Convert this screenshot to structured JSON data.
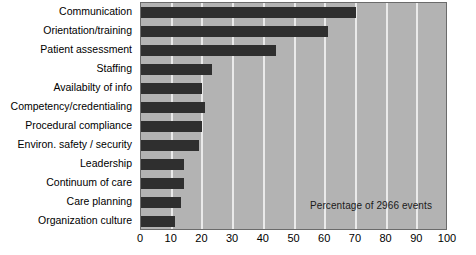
{
  "chart_data": {
    "type": "bar",
    "orientation": "horizontal",
    "title": "",
    "subtitle": "",
    "xlabel": "",
    "ylabel": "",
    "annotation": "Percentage of 2966 events",
    "xlim": [
      0,
      100
    ],
    "xticks": [
      0,
      10,
      20,
      30,
      40,
      50,
      60,
      70,
      80,
      90,
      100
    ],
    "grid": true,
    "legend": "none",
    "categories": [
      "Communication",
      "Orientation/training",
      "Patient assessment",
      "Staffing",
      "Availabilty of info",
      "Competency/credentialing",
      "Procedural compliance",
      "Environ. safety / security",
      "Leadership",
      "Continuum of care",
      "Care planning",
      "Organization culture"
    ],
    "values": [
      70,
      61,
      44,
      23,
      20,
      21,
      20,
      19,
      14,
      14,
      13,
      11
    ],
    "units": "percent",
    "colors": {
      "bar": "#2f2f2f",
      "plot_background": "#b3b3b3",
      "gridline": "#eaeaea",
      "frame": "#6b6b6b",
      "text": "#000000",
      "page_background": "#ffffff"
    }
  }
}
